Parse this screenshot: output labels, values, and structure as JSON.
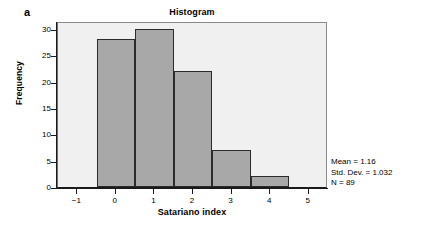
{
  "panel": {
    "label": "a"
  },
  "chart_data": {
    "type": "bar",
    "title": "Histogram",
    "xlabel": "Satariano index",
    "ylabel": "Frequency",
    "categories": [
      "0",
      "1",
      "2",
      "3",
      "4"
    ],
    "values": [
      28,
      30,
      22,
      7,
      2
    ],
    "bin_edges": [
      -0.5,
      0.5,
      1.5,
      2.5,
      3.5,
      4.5
    ],
    "bin_width": 1,
    "xlim": [
      -1.5,
      5.5
    ],
    "ylim": [
      0,
      31.5
    ],
    "xticks": [
      "−1",
      "0",
      "1",
      "2",
      "3",
      "4",
      "5"
    ],
    "xtick_values": [
      -1,
      0,
      1,
      2,
      3,
      4,
      5
    ],
    "yticks": [
      "0",
      "5",
      "10",
      "15",
      "20",
      "25",
      "30"
    ],
    "ytick_values": [
      0,
      5,
      10,
      15,
      20,
      25,
      30
    ],
    "grid": false,
    "legend": null,
    "bar_fill": "#a8a8a8",
    "bar_edge": "#2b2b2b",
    "plot_background": "#f0f0f0",
    "annotations": [
      "Mean = 1.16",
      "Std. Dev. = 1.032",
      "N = 89"
    ]
  },
  "stats": {
    "mean": "Mean = 1.16",
    "std_dev": "Std. Dev. = 1.032",
    "n": "N = 89"
  }
}
